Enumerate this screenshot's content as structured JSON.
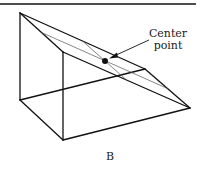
{
  "figure": {
    "panel_label": "B",
    "annotation": {
      "line1": "Center",
      "line2": "point"
    },
    "colors": {
      "stroke": "#111111",
      "thin_stroke": "#555555",
      "background": "#ffffff"
    },
    "shape": "triangular prism with sloped top face",
    "marked_point": "center point of sloped face"
  }
}
